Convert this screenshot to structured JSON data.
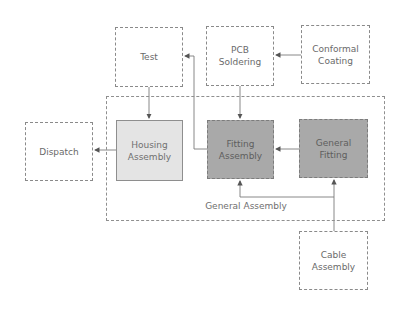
{
  "diagram": {
    "type": "process-flow",
    "container": {
      "label": "General Assembly"
    },
    "nodes": {
      "test": {
        "label": "Test",
        "style": "dashed"
      },
      "pcb_soldering": {
        "label": "PCB Soldering",
        "line1": "PCB",
        "line2": "Soldering",
        "style": "dashed"
      },
      "conformal_coating": {
        "label": "Conformal Coating",
        "line1": "Conformal",
        "line2": "Coating",
        "style": "dashed"
      },
      "dispatch": {
        "label": "Dispatch",
        "style": "dashed"
      },
      "housing_assembly": {
        "label": "Housing Assembly",
        "line1": "Housing",
        "line2": "Assembly",
        "style": "solid-light-gray"
      },
      "fitting_assembly": {
        "label": "Fitting Assembly",
        "line1": "Fitting",
        "line2": "Assembly",
        "style": "dashed-dark-gray"
      },
      "general_fitting": {
        "label": "General Fitting",
        "line1": "General",
        "line2": "Fitting",
        "style": "dashed-dark-gray"
      },
      "cable_assembly": {
        "label": "Cable Assembly",
        "line1": "Cable",
        "line2": "Assembly",
        "style": "dashed"
      }
    },
    "edges": [
      {
        "from": "Conformal Coating",
        "to": "PCB Soldering"
      },
      {
        "from": "PCB Soldering",
        "to": "Fitting Assembly"
      },
      {
        "from": "Fitting Assembly",
        "to": "Test"
      },
      {
        "from": "Test",
        "to": "Housing Assembly"
      },
      {
        "from": "Housing Assembly",
        "to": "Dispatch"
      },
      {
        "from": "General Fitting",
        "to": "Fitting Assembly"
      },
      {
        "from": "Cable Assembly",
        "to": "General Fitting"
      },
      {
        "from": "Cable Assembly",
        "to": "Fitting Assembly"
      }
    ],
    "colors": {
      "line": "#7a7a7a",
      "light_fill": "#e4e4e4",
      "dark_fill": "#a9a9a9",
      "text": "#6a6a6a"
    }
  }
}
